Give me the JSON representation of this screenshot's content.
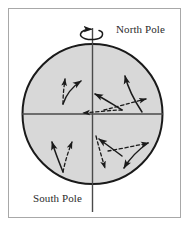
{
  "figure": {
    "type": "diagram",
    "background_color": "#ffffff",
    "frame_color": "#a8a8a8"
  },
  "labels": {
    "north_pole": "North Pole",
    "south_pole": "South Pole"
  },
  "globe": {
    "name": "earth-circle",
    "center_x": 92.5,
    "center_y": 114,
    "radius": 70,
    "fill_color": "#d8d8d8",
    "stroke_color": "#1a1a1a",
    "stroke_width": 2
  },
  "axis": {
    "name": "rotation-axis",
    "orientation": "vertical",
    "x": 92.5,
    "top_y": 28,
    "bottom_y": 212,
    "color": "#4a4a4a",
    "width": 1.4
  },
  "equator": {
    "name": "equator-line",
    "orientation": "horizontal",
    "y": 114,
    "left_x": 22,
    "right_x": 163,
    "color": "#4a4a4a",
    "width": 1.4
  },
  "rotation_arrow": {
    "name": "rotation-direction-arrow",
    "description": "counterclockwise spin arrow around north pole axis",
    "center_x": 92.5,
    "center_y": 34,
    "rx": 11,
    "ry": 5,
    "color": "#1a1a1a"
  },
  "legend": {
    "dashed_meaning": "intended path",
    "solid_meaning": "deflected path"
  },
  "arrow_pairs": [
    {
      "name": "arrow-pair-upper-left",
      "quadrant": "northern-hemisphere-west",
      "dashed": {
        "d": "M 63 104 C 63 94 64 87 65 79",
        "tip_angle": -87
      },
      "solid": {
        "d": "M 63 104 C 66 95 72 87 81 81",
        "tip_angle": -33
      }
    },
    {
      "name": "arrow-pair-center",
      "quadrant": "northern-hemisphere-center",
      "dashed": {
        "d": "M 122 110 C 110 110 98 112 83 113",
        "tip_angle": 183
      },
      "solid": {
        "d": "M 122 110 C 112 104 103 98 95 94",
        "tip_angle": 208
      }
    },
    {
      "name": "arrow-pair-upper-right",
      "quadrant": "northern-hemisphere-east",
      "dashed": {
        "d": "M 104 110 C 116 107 130 103 146 99",
        "tip_angle": -16
      },
      "solid": {
        "d": "M 142 112 C 134 100 128 88 125 76",
        "tip_angle": -76
      }
    },
    {
      "name": "arrow-pair-lower-left",
      "quadrant": "southern-hemisphere-west",
      "dashed": {
        "d": "M 63 172 C 65 162 68 152 72 142",
        "tip_angle": -68
      },
      "solid": {
        "d": "M 63 172 C 59 162 55 152 52 142",
        "tip_angle": -108
      }
    },
    {
      "name": "arrow-pair-lower-center",
      "quadrant": "southern-hemisphere-center",
      "dashed": {
        "d": "M 96 136 C 99 148 102 158 105 168",
        "tip_angle": 73
      },
      "solid": {
        "d": "M 122 156 C 114 150 106 144 99 139",
        "tip_angle": 217
      }
    },
    {
      "name": "arrow-pair-lower-right",
      "quadrant": "southern-hemisphere-east",
      "dashed": {
        "d": "M 108 151 C 120 149 134 146 148 143",
        "tip_angle": -12
      },
      "solid": {
        "d": "M 148 143 C 138 150 130 158 124 168",
        "tip_angle": 122
      }
    }
  ]
}
